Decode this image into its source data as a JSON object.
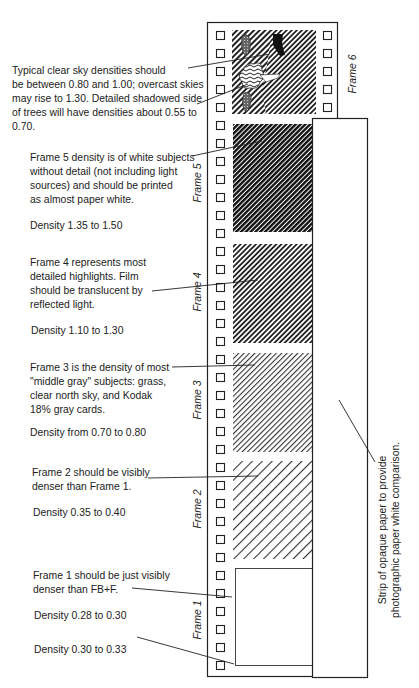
{
  "annotations": {
    "frame6": "Typical clear sky densities should\nbe between 0.80 and 1.00; overcast skies\nmay rise to 1.30.  Detailed shadowed side\nof trees will have densities about 0.55 to\n0.70.",
    "frame5": "Frame 5 density is of white subjects\nwithout detail (not including light\nsources) and should be printed\nas almost paper white.",
    "frame5_density": "Density  1.35 to 1.50",
    "frame4": "Frame 4  represents  most\ndetailed highlights.  Film\nshould be translucent by\nreflected light.",
    "frame4_density": "Density  1.10 to 1.30",
    "frame3": "Frame 3 is the density of most\n\"middle gray\" subjects: grass,\nclear north sky, and Kodak\n18% gray cards.",
    "frame3_density": "Density from 0.70 to 0.80",
    "frame2": "Frame 2 should be visibly\ndenser than Frame 1.",
    "frame2_density": "Density  0.35 to 0.40",
    "frame1": "Frame 1 should be just visibly\ndenser than FB+F.",
    "frame1_density": "Density  0.28 to 0.30",
    "fbf_density": "Density  0.30 to 0.33"
  },
  "frame_labels": {
    "f6": "Frame 6",
    "f5": "Frame 5",
    "f4": "Frame 4",
    "f3": "Frame 3",
    "f2": "Frame 2",
    "f1": "Frame 1"
  },
  "paper_strip": {
    "line1": "Strip of opaque paper to provide",
    "line2": "photographic paper white comparison."
  },
  "colors": {
    "ink": "#222222",
    "paper": "#ffffff"
  }
}
